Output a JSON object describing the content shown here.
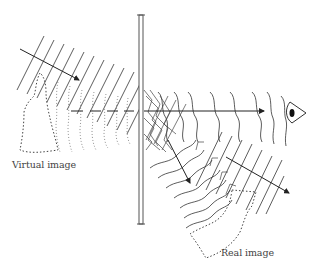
{
  "diagram": {
    "labels": {
      "virtual_image": "Virtual image",
      "real_image": "Real image"
    },
    "elements": {
      "hologram_plate": "vertical plate",
      "viewer": "eye-icon",
      "incident_beam": "reconstruction wave (straight wavefronts, upper-left)",
      "virtual_image_outline": "dotted silhouette behind plate",
      "real_image_outline": "dotted silhouette in front of plate",
      "transmitted_wave": "curved wavefronts heading to eye",
      "conjugate_wave": "diverging wavefronts toward lower-right"
    },
    "colors": {
      "line": "#333333",
      "plate": "#555555",
      "dotted": "#444444",
      "background": "#ffffff"
    }
  }
}
